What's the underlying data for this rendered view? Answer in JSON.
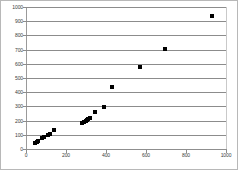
{
  "figure": {
    "background_color": "#ffffff",
    "frame_color": "#b8b8b8",
    "marker_color": "#000000",
    "gridline_color": "#8c8c8c",
    "axis_color": "#9a9a9a",
    "tick_label_color": "#3a3a3a"
  },
  "chart_data": {
    "type": "scatter",
    "title": "",
    "subtitle": "",
    "xlabel": "",
    "ylabel": "",
    "xlim": [
      0,
      1000
    ],
    "ylim": [
      0,
      1000
    ],
    "xticks": [
      0,
      200,
      400,
      600,
      800,
      1000
    ],
    "yticks": [
      0,
      100,
      200,
      300,
      400,
      500,
      600,
      700,
      800,
      900,
      1000
    ],
    "xtick_labels": [
      "0",
      "200",
      "400",
      "600",
      "800",
      "1000"
    ],
    "ytick_labels": [
      "0",
      "100",
      "200",
      "300",
      "400",
      "500",
      "600",
      "700",
      "800",
      "900",
      "1000"
    ],
    "grid": {
      "horizontal": true,
      "vertical": false
    },
    "legend": {
      "visible": false,
      "position": "none",
      "entries": []
    },
    "marker": {
      "shape": "square",
      "size": 4,
      "color": "#000000",
      "filled": true
    },
    "annotations": [],
    "series": [
      {
        "name": "series-1",
        "points": [
          {
            "x": 45,
            "y": 40
          },
          {
            "x": 55,
            "y": 50
          },
          {
            "x": 62,
            "y": 58
          },
          {
            "x": 78,
            "y": 75
          },
          {
            "x": 92,
            "y": 88
          },
          {
            "x": 108,
            "y": 100
          },
          {
            "x": 122,
            "y": 105
          },
          {
            "x": 142,
            "y": 137
          },
          {
            "x": 282,
            "y": 186
          },
          {
            "x": 290,
            "y": 193
          },
          {
            "x": 298,
            "y": 200
          },
          {
            "x": 305,
            "y": 205
          },
          {
            "x": 312,
            "y": 212
          },
          {
            "x": 318,
            "y": 215
          },
          {
            "x": 345,
            "y": 258
          },
          {
            "x": 392,
            "y": 293
          },
          {
            "x": 430,
            "y": 440
          },
          {
            "x": 570,
            "y": 578
          },
          {
            "x": 695,
            "y": 707
          },
          {
            "x": 930,
            "y": 935
          }
        ]
      }
    ]
  }
}
